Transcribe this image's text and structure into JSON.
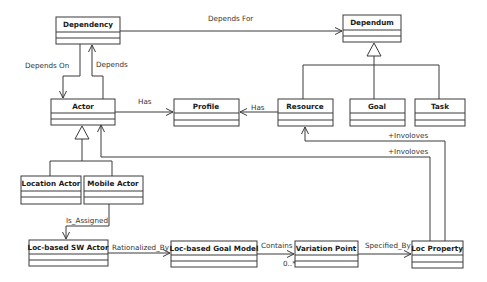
{
  "diagram": {
    "type": "UML class diagram",
    "classes": [
      {
        "id": "dependency",
        "name": "Dependency",
        "x": 56,
        "y": 17,
        "w": 64,
        "h": 27
      },
      {
        "id": "dependum",
        "name": "Dependum",
        "x": 343,
        "y": 15,
        "w": 58,
        "h": 27
      },
      {
        "id": "actor",
        "name": "Actor",
        "x": 51,
        "y": 99,
        "w": 64,
        "h": 26
      },
      {
        "id": "profile",
        "name": "Profile",
        "x": 174,
        "y": 99,
        "w": 65,
        "h": 27
      },
      {
        "id": "resource",
        "name": "Resource",
        "x": 278,
        "y": 99,
        "w": 55,
        "h": 27
      },
      {
        "id": "goal",
        "name": "Goal",
        "x": 350,
        "y": 99,
        "w": 55,
        "h": 27
      },
      {
        "id": "task",
        "name": "Task",
        "x": 415,
        "y": 99,
        "w": 50,
        "h": 27
      },
      {
        "id": "location-actor",
        "name": "Location Actor",
        "x": 21,
        "y": 176,
        "w": 60,
        "h": 28
      },
      {
        "id": "mobile-actor",
        "name": "Mobile Actor",
        "x": 84,
        "y": 176,
        "w": 59,
        "h": 28
      },
      {
        "id": "loc-based-sw-actor",
        "name": "Loc-based SW Actor",
        "x": 29,
        "y": 240,
        "w": 79,
        "h": 26
      },
      {
        "id": "loc-based-goal-model",
        "name": "Loc-based Goal Model",
        "x": 171,
        "y": 241,
        "w": 86,
        "h": 26
      },
      {
        "id": "variation-point",
        "name": "Variation Point",
        "x": 295,
        "y": 241,
        "w": 63,
        "h": 26
      },
      {
        "id": "loc-property",
        "name": "Loc Property",
        "x": 412,
        "y": 241,
        "w": 51,
        "h": 27
      }
    ],
    "relations": [
      {
        "id": "depends-for",
        "label": "Depends For",
        "from": "Dependency",
        "to": "Dependum"
      },
      {
        "id": "depends-on",
        "label": "Depends On",
        "from": "Dependency",
        "to": "Actor"
      },
      {
        "id": "depends",
        "label": "Depends",
        "from": "Actor",
        "to": "Dependency"
      },
      {
        "id": "actor-has-profile",
        "label": "Has",
        "from": "Actor",
        "to": "Profile"
      },
      {
        "id": "resource-has-profile",
        "label": "Has",
        "from": "Resource",
        "to": "Profile"
      },
      {
        "id": "involves-resource",
        "label": "+Involoves",
        "from": "Loc Property",
        "to": "Resource"
      },
      {
        "id": "involves-actor",
        "label": "+Involoves",
        "from": "Loc Property",
        "to": "Actor"
      },
      {
        "id": "is-assigned",
        "label": "Is_Assigned",
        "from": "Mobile Actor",
        "to": "Loc-based SW Actor"
      },
      {
        "id": "rationalized-by",
        "label": "Rationalized_By",
        "from": "Loc-based SW Actor",
        "to": "Loc-based Goal Model"
      },
      {
        "id": "contains",
        "label": "Contains",
        "multiplicity": "0..*",
        "from": "Loc-based Goal Model",
        "to": "Variation Point"
      },
      {
        "id": "specified-by",
        "label": "Specified_By",
        "from": "Variation Point",
        "to": "Loc Property"
      }
    ],
    "generalizations": [
      {
        "parent": "Dependum",
        "children": [
          "Resource",
          "Goal",
          "Task"
        ]
      },
      {
        "parent": "Actor",
        "children": [
          "Location Actor",
          "Mobile Actor"
        ]
      }
    ]
  },
  "labels": {
    "dependency": "Dependency",
    "dependum": "Dependum",
    "actor": "Actor",
    "profile": "Profile",
    "resource": "Resource",
    "goal": "Goal",
    "task": "Task",
    "location_actor": "Location Actor",
    "mobile_actor": "Mobile Actor",
    "sw_actor": "Loc-based SW Actor",
    "goal_model": "Loc-based Goal Model",
    "variation_point": "Variation Point",
    "loc_property": "Loc Property",
    "depends_for": "Depends For",
    "depends_on": "Depends On",
    "depends": "Depends",
    "has1": "Has",
    "has2": "Has",
    "involves1": "+Involoves",
    "involves2": "+Involoves",
    "is_assigned": "Is_Assigned",
    "rationalized_by": "Rationalized_By",
    "contains": "Contains",
    "multiplicity": "0..*",
    "specified_by": "Specified_By"
  }
}
